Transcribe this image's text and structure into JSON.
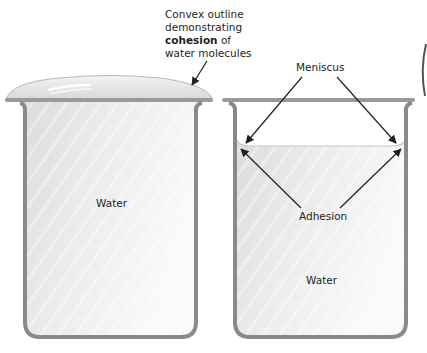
{
  "figure": {
    "left_beaker": {
      "annotation_lines": [
        "Convex outline",
        "demonstrating",
        "of",
        "water molecules"
      ],
      "annotation_bold": "cohesion",
      "water_label": "Water"
    },
    "right_beaker": {
      "meniscus_label": "Meniscus",
      "adhesion_label": "Adhesion",
      "water_label": "Water"
    },
    "colors": {
      "glass_outline": "#8a8a8a",
      "water_fill": "#e6e6e6",
      "text": "#231f20",
      "arrow": "#231f20"
    }
  }
}
